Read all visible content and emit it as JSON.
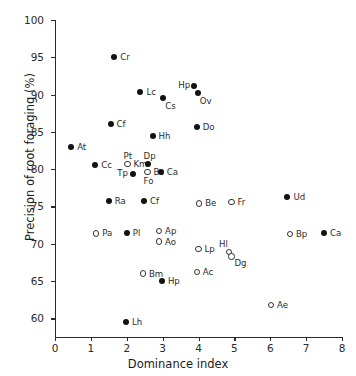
{
  "chart_data": {
    "type": "scatter",
    "title": "",
    "xlabel": "Dominance index",
    "ylabel": "Precision of root foraging (%)",
    "xlim": [
      0,
      8
    ],
    "ylim": [
      57.5,
      100
    ],
    "xticks": [
      0,
      1,
      2,
      3,
      4,
      5,
      6,
      7,
      8
    ],
    "yticks": [
      60,
      65,
      70,
      75,
      80,
      85,
      90,
      95,
      100
    ],
    "xtick_labels": [
      "0",
      "1",
      "2",
      "3",
      "4",
      "5",
      "6",
      "7",
      "8"
    ],
    "ytick_labels": [
      "60",
      "65",
      "70",
      "75",
      "80",
      "85",
      "90",
      "95",
      "100"
    ],
    "grid": false,
    "legend": "none",
    "marker_styles": {
      "filled": "closed black circle",
      "open": "open white circle with black outline"
    },
    "points": [
      {
        "label": "Cr",
        "x": 1.65,
        "y": 95.1,
        "marker": "filled",
        "label_pos": "right"
      },
      {
        "label": "Hp",
        "x": 3.88,
        "y": 91.2,
        "marker": "filled",
        "label_pos": "left"
      },
      {
        "label": "Ov",
        "x": 3.98,
        "y": 90.2,
        "marker": "filled",
        "label_pos": "right-below"
      },
      {
        "label": "Lc",
        "x": 2.38,
        "y": 90.4,
        "marker": "filled",
        "label_pos": "right"
      },
      {
        "label": "Cs",
        "x": 3.02,
        "y": 89.6,
        "marker": "filled",
        "label_pos": "right-below"
      },
      {
        "label": "Do",
        "x": 3.95,
        "y": 85.6,
        "marker": "filled",
        "label_pos": "right"
      },
      {
        "label": "Cf",
        "x": 1.55,
        "y": 86.0,
        "marker": "filled",
        "label_pos": "right"
      },
      {
        "label": "Hh",
        "x": 2.72,
        "y": 84.4,
        "marker": "filled",
        "label_pos": "right"
      },
      {
        "label": "At",
        "x": 0.45,
        "y": 83.0,
        "marker": "filled",
        "label_pos": "right"
      },
      {
        "label": "Cc",
        "x": 1.12,
        "y": 80.5,
        "marker": "filled",
        "label_pos": "right"
      },
      {
        "label": "Pt",
        "x": 2.02,
        "y": 80.7,
        "marker": "open",
        "label_pos": "above"
      },
      {
        "label": "Km",
        "x": 2.02,
        "y": 80.7,
        "marker": "none",
        "label_pos": "right"
      },
      {
        "label": "Dp",
        "x": 2.58,
        "y": 80.7,
        "marker": "filled",
        "label_pos": "above"
      },
      {
        "label": "Bs",
        "x": 2.58,
        "y": 79.6,
        "marker": "open",
        "label_pos": "right"
      },
      {
        "label": "Fo",
        "x": 2.58,
        "y": 79.6,
        "marker": "none",
        "label_pos": "below"
      },
      {
        "label": "Tp",
        "x": 2.18,
        "y": 79.4,
        "marker": "filled",
        "label_pos": "left"
      },
      {
        "label": "Ca",
        "x": 2.95,
        "y": 79.6,
        "marker": "filled",
        "label_pos": "right"
      },
      {
        "label": "Ra",
        "x": 1.5,
        "y": 75.8,
        "marker": "filled",
        "label_pos": "right"
      },
      {
        "label": "Cf",
        "x": 2.48,
        "y": 75.8,
        "marker": "filled",
        "label_pos": "right"
      },
      {
        "label": "Be",
        "x": 4.02,
        "y": 75.4,
        "marker": "open",
        "label_pos": "right"
      },
      {
        "label": "Fr",
        "x": 4.92,
        "y": 75.6,
        "marker": "open",
        "label_pos": "right"
      },
      {
        "label": "Ud",
        "x": 6.48,
        "y": 76.3,
        "marker": "filled",
        "label_pos": "right"
      },
      {
        "label": "Pa",
        "x": 1.15,
        "y": 71.4,
        "marker": "open",
        "label_pos": "right"
      },
      {
        "label": "Pl",
        "x": 2.0,
        "y": 71.5,
        "marker": "filled",
        "label_pos": "right"
      },
      {
        "label": "Ap",
        "x": 2.9,
        "y": 71.7,
        "marker": "open",
        "label_pos": "right"
      },
      {
        "label": "Ao",
        "x": 2.9,
        "y": 70.3,
        "marker": "open",
        "label_pos": "right"
      },
      {
        "label": "Bp",
        "x": 6.55,
        "y": 71.3,
        "marker": "open",
        "label_pos": "right"
      },
      {
        "label": "Ca",
        "x": 7.5,
        "y": 71.4,
        "marker": "filled",
        "label_pos": "right"
      },
      {
        "label": "Lp",
        "x": 4.0,
        "y": 69.3,
        "marker": "open",
        "label_pos": "right"
      },
      {
        "label": "Hl",
        "x": 4.85,
        "y": 68.9,
        "marker": "open",
        "label_pos": "above-left"
      },
      {
        "label": "Dg",
        "x": 4.92,
        "y": 68.3,
        "marker": "open",
        "label_pos": "below-right"
      },
      {
        "label": "Bm",
        "x": 2.45,
        "y": 66.0,
        "marker": "open",
        "label_pos": "right"
      },
      {
        "label": "Ac",
        "x": 3.95,
        "y": 66.2,
        "marker": "open",
        "label_pos": "right"
      },
      {
        "label": "Hp",
        "x": 2.98,
        "y": 65.0,
        "marker": "filled",
        "label_pos": "right"
      },
      {
        "label": "Ae",
        "x": 6.02,
        "y": 61.8,
        "marker": "open",
        "label_pos": "right"
      },
      {
        "label": "Lh",
        "x": 1.98,
        "y": 59.5,
        "marker": "filled",
        "label_pos": "right"
      }
    ]
  }
}
